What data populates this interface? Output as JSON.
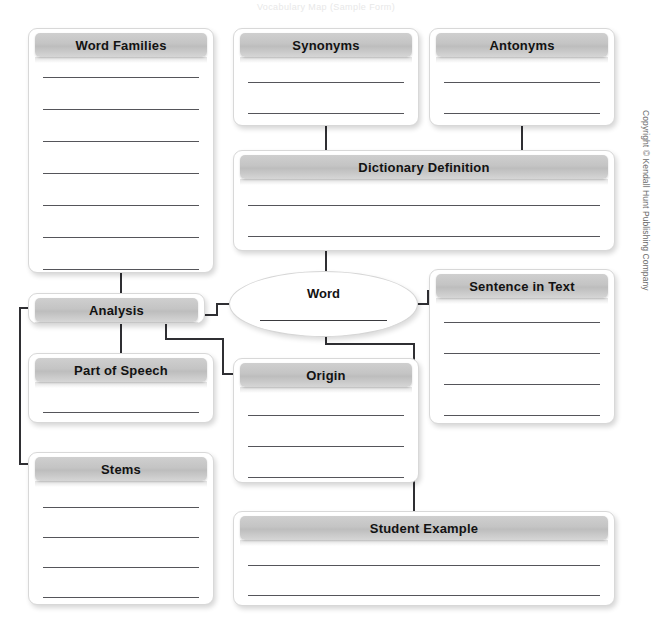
{
  "page": {
    "top_faint_text": "Vocabulary Map (Sample Form)",
    "copyright": "Copyright © Kendall Hunt Publishing Company",
    "line_color": "#55555a",
    "title_bar_color": "#c4c4c4",
    "connector_color": "#2f2f33",
    "background": "#ffffff"
  },
  "nodes": {
    "word_families": {
      "label": "Word Families",
      "lines": 7
    },
    "synonyms": {
      "label": "Synonyms",
      "lines": 2
    },
    "antonyms": {
      "label": "Antonyms",
      "lines": 2
    },
    "dictionary": {
      "label": "Dictionary Definition",
      "lines": 2
    },
    "word": {
      "label": "Word",
      "lines": 1
    },
    "sentence": {
      "label": "Sentence in Text",
      "lines": 4
    },
    "analysis": {
      "label": "Analysis",
      "lines": 0
    },
    "part_of_speech": {
      "label": "Part of Speech",
      "lines": 1
    },
    "origin": {
      "label": "Origin",
      "lines": 3
    },
    "stems": {
      "label": "Stems",
      "lines": 4
    },
    "student_example": {
      "label": "Student Example",
      "lines": 2
    }
  },
  "connectors": [
    {
      "name": "synonyms-to-dictionary"
    },
    {
      "name": "antonyms-to-dictionary"
    },
    {
      "name": "dictionary-to-word"
    },
    {
      "name": "word-families-to-analysis"
    },
    {
      "name": "word-to-analysis"
    },
    {
      "name": "word-to-sentence-in-text"
    },
    {
      "name": "analysis-to-part-of-speech"
    },
    {
      "name": "analysis-to-stems"
    },
    {
      "name": "analysis-to-origin"
    },
    {
      "name": "word-to-student-example"
    }
  ]
}
